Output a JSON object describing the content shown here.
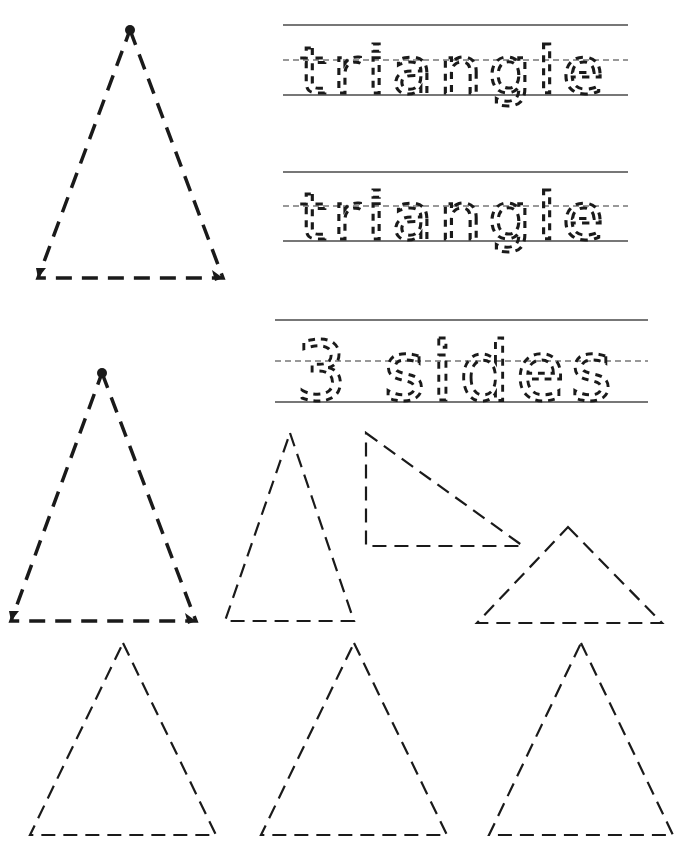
{
  "worksheet": {
    "title_word": "triangle",
    "trace_rows": [
      {
        "text": "triangle"
      },
      {
        "text": "triangle"
      },
      {
        "text": "3 sides"
      }
    ],
    "shape": "triangle",
    "sides_count": "3",
    "colors": {
      "ink": "#1a1a1a",
      "guide_lines": "#777777",
      "paper": "#ffffff"
    }
  },
  "shapes": {
    "demo_triangles": [
      {
        "name": "example-triangle-1",
        "points": "130,30 223,278 38,278",
        "start_dot": [
          130,
          30
        ]
      },
      {
        "name": "example-triangle-2",
        "points": "102,373 196,621 11,621",
        "start_dot": [
          102,
          373
        ]
      }
    ],
    "practice_triangles": [
      {
        "name": "tall-triangle",
        "points": "290,433 354,621 225,621"
      },
      {
        "name": "right-triangle",
        "points": "366,433 523,546 366,546"
      },
      {
        "name": "wide-triangle",
        "points": "568,527 662,623 477,623"
      },
      {
        "name": "bottom-triangle-1",
        "points": "123,643 216,835 30,835"
      },
      {
        "name": "bottom-triangle-2",
        "points": "354,643 447,835 261,835"
      },
      {
        "name": "bottom-triangle-3",
        "points": "581,643 673,835 489,835"
      }
    ]
  }
}
